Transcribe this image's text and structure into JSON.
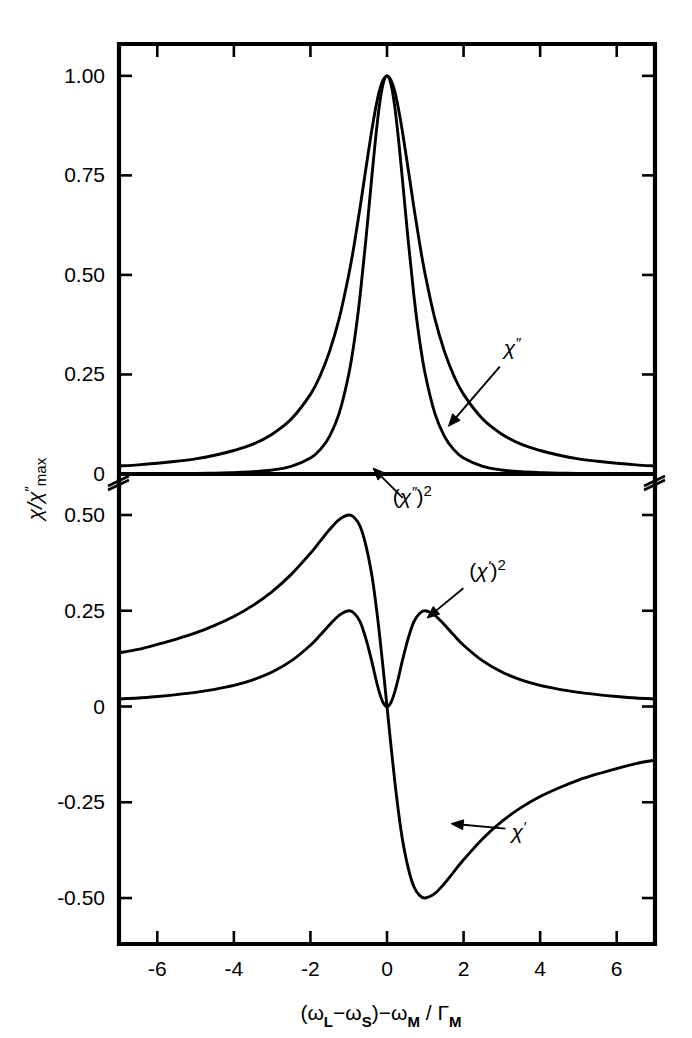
{
  "figure": {
    "axis_label_y": "χ/χ″max",
    "axis_label_y_parts": {
      "main": "χ/χ",
      "prime": "″",
      "sub": "max"
    },
    "axis_label_x": "(ωL−ωS)−ωM / ΓM",
    "axis_label_x_parts": {
      "open": "(",
      "omega1": "ω",
      "sub1": "L",
      "minus1": "−",
      "omega2": "ω",
      "sub2": "S",
      "close": ")",
      "minus2": "−",
      "omega3": "ω",
      "sub3": "M",
      "slash": " / ",
      "gamma": "Γ",
      "sub4": "M"
    },
    "axis_break_note": "broken y-axis between upper and lower panel",
    "line_color": "#000000",
    "background_color": "#ffffff"
  },
  "chart_data": {
    "type": "line",
    "title": "",
    "subtitle": "",
    "xlabel": "(ωL−ωS)−ωM / ΓM",
    "ylabel": "χ/χ″max",
    "grid": false,
    "legend": "annotations",
    "legend_position": "inline-arrow-annotations",
    "broken_axis": true,
    "panels": [
      {
        "id": "upper",
        "ylim": [
          0,
          1.08
        ],
        "xlim": [
          -7,
          7
        ],
        "yticks": [
          0,
          0.25,
          0.5,
          0.75,
          1.0
        ],
        "ytick_labels": [
          "0",
          "0.25",
          "0.50",
          "0.75",
          "1.00"
        ],
        "xticks": [
          -6,
          -4,
          -2,
          0,
          2,
          4,
          6
        ],
        "xtick_labels": [
          "",
          "",
          "",
          "",
          "",
          "",
          ""
        ],
        "series": [
          {
            "name": "χ″",
            "label": "χ″",
            "formula": "1/(1+x^2)",
            "x": [
              -7,
              -6.5,
              -6,
              -5.5,
              -5,
              -4.5,
              -4,
              -3.5,
              -3,
              -2.5,
              -2,
              -1.75,
              -1.5,
              -1.25,
              -1,
              -0.85,
              -0.7,
              -0.55,
              -0.4,
              -0.3,
              -0.2,
              -0.1,
              0,
              0.1,
              0.2,
              0.3,
              0.4,
              0.55,
              0.7,
              0.85,
              1,
              1.25,
              1.5,
              1.75,
              2,
              2.5,
              3,
              3.5,
              4,
              4.5,
              5,
              5.5,
              6,
              6.5,
              7
            ],
            "y": [
              0.02,
              0.023,
              0.027,
              0.032,
              0.038,
              0.047,
              0.059,
              0.075,
              0.1,
              0.138,
              0.2,
              0.246,
              0.308,
              0.39,
              0.5,
              0.58,
              0.671,
              0.768,
              0.862,
              0.917,
              0.962,
              0.99,
              1.0,
              0.99,
              0.962,
              0.917,
              0.862,
              0.768,
              0.671,
              0.58,
              0.5,
              0.39,
              0.308,
              0.246,
              0.2,
              0.138,
              0.1,
              0.075,
              0.059,
              0.047,
              0.038,
              0.032,
              0.027,
              0.023,
              0.02
            ]
          },
          {
            "name": "(χ″)²",
            "label": "(χ″)²",
            "formula": "1/(1+x^2)^2",
            "x": [
              -7,
              -6,
              -5,
              -4.5,
              -4,
              -3.5,
              -3,
              -2.5,
              -2,
              -1.75,
              -1.5,
              -1.25,
              -1,
              -0.85,
              -0.7,
              -0.55,
              -0.4,
              -0.3,
              -0.2,
              -0.1,
              0,
              0.1,
              0.2,
              0.3,
              0.4,
              0.55,
              0.7,
              0.85,
              1,
              1.25,
              1.5,
              1.75,
              2,
              2.5,
              3,
              3.5,
              4,
              4.5,
              5,
              6,
              7
            ],
            "y": [
              0.0004,
              0.0007,
              0.0015,
              0.0022,
              0.0035,
              0.0056,
              0.01,
              0.019,
              0.04,
              0.0605,
              0.0947,
              0.1522,
              0.25,
              0.3364,
              0.4502,
              0.5898,
              0.743,
              0.841,
              0.9247,
              0.9803,
              1.0,
              0.9803,
              0.9247,
              0.841,
              0.743,
              0.5898,
              0.4502,
              0.3364,
              0.25,
              0.1522,
              0.0947,
              0.0605,
              0.04,
              0.019,
              0.01,
              0.0056,
              0.0035,
              0.0022,
              0.0015,
              0.0007,
              0.0004
            ]
          }
        ],
        "annotations": [
          {
            "text": "χ″",
            "label_x": 3.05,
            "label_y": 0.3,
            "point_x": 1.45,
            "point_y": 0.105
          },
          {
            "text": "(χ″)²",
            "label_x": 0.15,
            "label_y": -0.075,
            "point_x": -0.52,
            "point_y": 0.035
          }
        ]
      },
      {
        "id": "lower",
        "ylim": [
          -0.62,
          0.56
        ],
        "xlim": [
          -7,
          7
        ],
        "yticks": [
          -0.5,
          -0.25,
          0,
          0.25,
          0.5
        ],
        "ytick_labels": [
          "-0.50",
          "-0.25",
          "0",
          "0.25",
          "0.50"
        ],
        "xticks": [
          -6,
          -4,
          -2,
          0,
          2,
          4,
          6
        ],
        "xtick_labels": [
          "-6",
          "-4",
          "-2",
          "0",
          "2",
          "4",
          "6"
        ],
        "series": [
          {
            "name": "χ′",
            "label": "χ′",
            "formula": "-x/(1+x^2)",
            "x": [
              -7,
              -6.5,
              -6,
              -5.5,
              -5,
              -4.5,
              -4,
              -3.5,
              -3,
              -2.5,
              -2,
              -1.75,
              -1.5,
              -1.25,
              -1,
              -0.85,
              -0.7,
              -0.55,
              -0.4,
              -0.3,
              -0.2,
              -0.1,
              0,
              0.1,
              0.2,
              0.3,
              0.4,
              0.55,
              0.7,
              0.85,
              1,
              1.25,
              1.5,
              1.75,
              2,
              2.5,
              3,
              3.5,
              4,
              4.5,
              5,
              5.5,
              6,
              6.5,
              7
            ],
            "y": [
              0.14,
              0.149,
              0.162,
              0.176,
              0.192,
              0.212,
              0.235,
              0.264,
              0.3,
              0.345,
              0.4,
              0.431,
              0.462,
              0.488,
              0.5,
              0.493,
              0.47,
              0.42,
              0.345,
              0.275,
              0.192,
              0.099,
              0.0,
              -0.099,
              -0.192,
              -0.275,
              -0.345,
              -0.42,
              -0.47,
              -0.493,
              -0.5,
              -0.488,
              -0.462,
              -0.431,
              -0.4,
              -0.345,
              -0.3,
              -0.264,
              -0.235,
              -0.212,
              -0.192,
              -0.176,
              -0.162,
              -0.149,
              -0.14
            ]
          },
          {
            "name": "(χ′)²",
            "label": "(χ′)²",
            "formula": "x^2/(1+x^2)^2",
            "x": [
              -7,
              -6.5,
              -6,
              -5.5,
              -5,
              -4.5,
              -4,
              -3.5,
              -3,
              -2.5,
              -2,
              -1.75,
              -1.5,
              -1.25,
              -1,
              -0.85,
              -0.7,
              -0.55,
              -0.4,
              -0.3,
              -0.2,
              -0.1,
              0,
              0.1,
              0.2,
              0.3,
              0.4,
              0.55,
              0.7,
              0.85,
              1,
              1.25,
              1.5,
              1.75,
              2,
              2.5,
              3,
              3.5,
              4,
              4.5,
              5,
              5.5,
              6,
              6.5,
              7
            ],
            "y": [
              0.0196,
              0.0222,
              0.0262,
              0.031,
              0.0369,
              0.0449,
              0.0552,
              0.0697,
              0.09,
              0.119,
              0.16,
              0.1858,
              0.2134,
              0.2381,
              0.25,
              0.243,
              0.2209,
              0.1764,
              0.119,
              0.0756,
              0.0369,
              0.0098,
              0.0,
              0.0098,
              0.0369,
              0.0756,
              0.119,
              0.1764,
              0.2209,
              0.243,
              0.25,
              0.2381,
              0.2134,
              0.1858,
              0.16,
              0.119,
              0.09,
              0.0697,
              0.0552,
              0.0449,
              0.0369,
              0.031,
              0.0262,
              0.0222,
              0.0196
            ]
          }
        ],
        "annotations": [
          {
            "text": "(χ′)²",
            "label_x": 2.15,
            "label_y": 0.335,
            "point_x": 0.92,
            "point_y": 0.218
          },
          {
            "text": "χ′",
            "label_x": 3.25,
            "label_y": -0.345,
            "point_x": 1.52,
            "point_y": -0.285
          }
        ]
      }
    ]
  }
}
